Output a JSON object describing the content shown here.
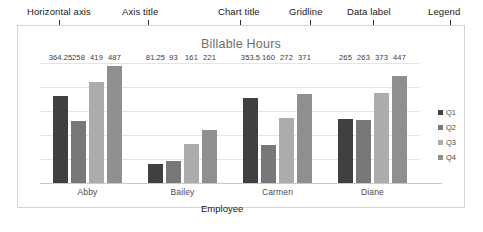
{
  "annotations": [
    {
      "label": "Horizontal axis",
      "points_to": "x-axis"
    },
    {
      "label": "Axis title",
      "points_to": "employee-axis-title"
    },
    {
      "label": "Chart title",
      "points_to": "chart-title"
    },
    {
      "label": "Gridline",
      "points_to": "gridline"
    },
    {
      "label": "Data label",
      "points_to": "data-label-263"
    },
    {
      "label": "Legend",
      "points_to": "legend-q1"
    }
  ],
  "axis_title": "Employee",
  "chart_data": {
    "type": "bar",
    "title": "Billable Hours",
    "xlabel": "Employee",
    "ylabel": "",
    "categories": [
      "Abby",
      "Bailey",
      "Carmen",
      "Diane"
    ],
    "series": [
      {
        "name": "Q1",
        "color": "#404040",
        "values": [
          364.25,
          81.25,
          353.5,
          265
        ]
      },
      {
        "name": "Q2",
        "color": "#787878",
        "values": [
          258,
          93,
          160,
          263
        ]
      },
      {
        "name": "Q3",
        "color": "#acacac",
        "values": [
          419,
          161,
          272,
          373
        ]
      },
      {
        "name": "Q4",
        "color": "#8f8f8f",
        "values": [
          487,
          221,
          371,
          447
        ]
      }
    ],
    "ylim": [
      0,
      500
    ],
    "gridlines": [
      100,
      200,
      300,
      400,
      500
    ],
    "grid": true,
    "legend_position": "right",
    "data_labels_shown": true
  }
}
